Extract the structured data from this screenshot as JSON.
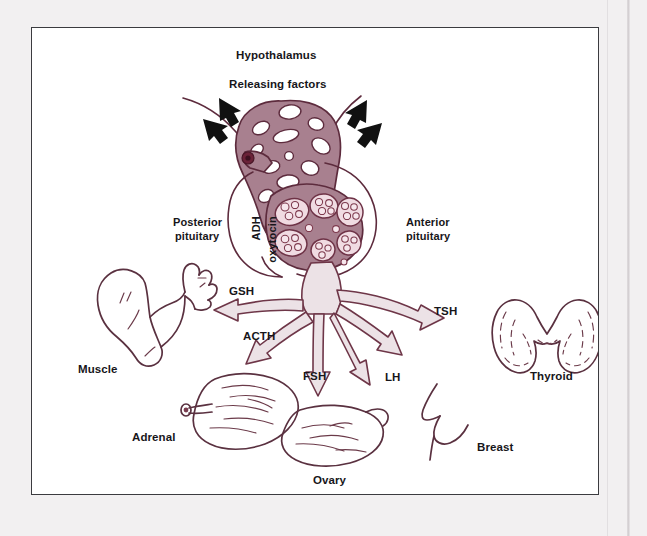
{
  "figure": {
    "colors": {
      "page_background": "#f2f0f1",
      "panel_background": "#ffffff",
      "frame_border": "#3b3b3f",
      "outline": "#5d2b3d",
      "tissue_fill": "#a8808f",
      "cell_fill": "#f0dbe2",
      "arrow_fill": "#ece2e6",
      "organ_outline": "#5a3140",
      "text": "#17161a",
      "black_arrow": "#111111"
    }
  },
  "labels": {
    "hypothalamus": "Hypothalamus",
    "releasing_factors": "Releasing factors",
    "posterior_pituitary_line1": "Posterior",
    "posterior_pituitary_line2": "pituitary",
    "anterior_pituitary_line1": "Anterior",
    "anterior_pituitary_line2": "pituitary",
    "adh": "ADH",
    "oxytocin": "oxytocin"
  },
  "hormones": [
    {
      "name": "GSH",
      "target": "Muscle",
      "direction": "left"
    },
    {
      "name": "ACTH",
      "target": "Adrenal",
      "direction": "down-left"
    },
    {
      "name": "FSH",
      "target": "Ovary",
      "direction": "down"
    },
    {
      "name": "LH",
      "target": "Ovary",
      "direction": "down-right"
    },
    {
      "name": "TSH",
      "target": "Thyroid",
      "direction": "right"
    }
  ],
  "organs": [
    {
      "name": "Muscle",
      "label": "Muscle"
    },
    {
      "name": "Adrenal",
      "label": "Adrenal"
    },
    {
      "name": "Ovary",
      "label": "Ovary"
    },
    {
      "name": "Breast",
      "label": "Breast"
    },
    {
      "name": "Thyroid",
      "label": "Thyroid"
    }
  ],
  "hormone_labels": {
    "gsh": "GSH",
    "acth": "ACTH",
    "fsh": "FSH",
    "lh": "LH",
    "tsh": "TSH"
  },
  "organ_labels": {
    "muscle": "Muscle",
    "adrenal": "Adrenal",
    "ovary": "Ovary",
    "breast": "Breast",
    "thyroid": "Thyroid"
  },
  "releasing_factor_arrows": 4
}
